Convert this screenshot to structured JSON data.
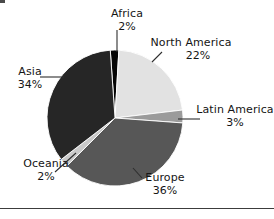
{
  "chart_data": {
    "type": "pie",
    "title": "",
    "categories": [
      "Africa",
      "North America",
      "Latin America",
      "Europe",
      "Oceania",
      "Asia"
    ],
    "values": [
      2,
      22,
      3,
      36,
      2,
      34
    ],
    "unit": "%",
    "legend": "none",
    "labels_inline": true,
    "start_angle_deg": -4,
    "direction": "clockwise",
    "slice_colors": [
      "#050505",
      "#e2e2e2",
      "#9b9b9b",
      "#575757",
      "#c9c9c9",
      "#262626"
    ],
    "slices": [
      {
        "label": "Africa",
        "value": 2,
        "display": "2%",
        "color": "#050505"
      },
      {
        "label": "North America",
        "value": 22,
        "display": "22%",
        "color": "#e2e2e2"
      },
      {
        "label": "Latin America",
        "value": 3,
        "display": "3%",
        "color": "#9b9b9b"
      },
      {
        "label": "Europe",
        "value": 36,
        "display": "36%",
        "color": "#575757"
      },
      {
        "label": "Oceania",
        "value": 2,
        "display": "2%",
        "color": "#c9c9c9"
      },
      {
        "label": "Asia",
        "value": 34,
        "display": "34%",
        "color": "#262626"
      }
    ]
  },
  "labels": {
    "africa": {
      "name": "Africa",
      "value": "2%"
    },
    "north_america": {
      "name": "North America",
      "value": "22%"
    },
    "latin_america": {
      "name": "Latin America",
      "value": "3%"
    },
    "europe": {
      "name": "Europe",
      "value": "36%"
    },
    "oceania": {
      "name": "Oceania",
      "value": "2%"
    },
    "asia": {
      "name": "Asia",
      "value": "34%"
    }
  },
  "style": {
    "background": "#ffffff",
    "text_color": "#151515",
    "leader_line_color": "#2e2e2e",
    "rule_color": "#3c3c3c"
  }
}
